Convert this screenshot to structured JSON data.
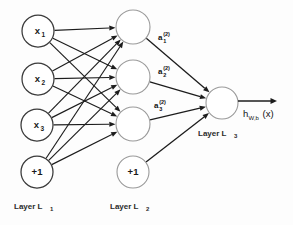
{
  "diagram": {
    "background_color": "#fdfdfd",
    "edge_color": "#1c1c1c",
    "input_node_stroke": "#3a3a3a",
    "hidden_node_stroke": "#9a9a9a",
    "output_node_stroke": "#9a9a9a"
  },
  "layers": [
    {
      "id": "L1",
      "caption_text": "Layer L",
      "caption_sub": "1",
      "caption_x": 14,
      "caption_y": 209,
      "nodes": [
        {
          "name": "input-node-x1",
          "label": "x",
          "sub": "1",
          "cx": 38,
          "cy": 31,
          "r": 16
        },
        {
          "name": "input-node-x2",
          "label": "x",
          "sub": "2",
          "cx": 38,
          "cy": 79,
          "r": 16
        },
        {
          "name": "input-node-x3",
          "label": "x",
          "sub": "3",
          "cx": 37,
          "cy": 125,
          "r": 16
        },
        {
          "name": "input-node-bias",
          "label": "+1",
          "sub": "",
          "cx": 37,
          "cy": 172,
          "r": 16
        }
      ]
    },
    {
      "id": "L2",
      "caption_text": "Layer L",
      "caption_sub": "2",
      "caption_x": 110,
      "caption_y": 209,
      "nodes": [
        {
          "name": "hidden-node-1",
          "label": "",
          "sub": "",
          "cx": 133,
          "cy": 27,
          "r": 17
        },
        {
          "name": "hidden-node-2",
          "label": "",
          "sub": "",
          "cx": 133,
          "cy": 77,
          "r": 17
        },
        {
          "name": "hidden-node-3",
          "label": "",
          "sub": "",
          "cx": 133,
          "cy": 124,
          "r": 17
        },
        {
          "name": "hidden-node-bias",
          "label": "+1",
          "sub": "",
          "cx": 133,
          "cy": 172,
          "r": 16
        }
      ]
    },
    {
      "id": "L3",
      "caption_text": "Layer L",
      "caption_sub": "3",
      "caption_x": 198,
      "caption_y": 136,
      "nodes": [
        {
          "name": "output-node",
          "label": "",
          "sub": "",
          "cx": 222,
          "cy": 103,
          "r": 16
        }
      ]
    }
  ],
  "activation_labels": [
    {
      "name": "activation-label-a1",
      "base": "a",
      "sup": "(2)",
      "sub": "1",
      "x": 158,
      "y": 40
    },
    {
      "name": "activation-label-a2",
      "base": "a",
      "sup": "(2)",
      "sub": "2",
      "x": 158,
      "y": 74
    },
    {
      "name": "activation-label-a3",
      "base": "a",
      "sup": "(2)",
      "sub": "3",
      "x": 154,
      "y": 108
    }
  ],
  "output": {
    "arrow": {
      "x1": 238,
      "y1": 101,
      "x2": 277,
      "y2": 101
    },
    "label_name": "output-label",
    "label_base": "h",
    "label_sub": "W,b",
    "label_tail": "(x)",
    "label_x": 243,
    "label_y": 117
  },
  "edges_input_to_hidden": [
    {
      "from": "input-node-x1",
      "to": "hidden-node-1"
    },
    {
      "from": "input-node-x1",
      "to": "hidden-node-2"
    },
    {
      "from": "input-node-x1",
      "to": "hidden-node-3"
    },
    {
      "from": "input-node-x2",
      "to": "hidden-node-1"
    },
    {
      "from": "input-node-x2",
      "to": "hidden-node-2"
    },
    {
      "from": "input-node-x2",
      "to": "hidden-node-3"
    },
    {
      "from": "input-node-x3",
      "to": "hidden-node-1"
    },
    {
      "from": "input-node-x3",
      "to": "hidden-node-2"
    },
    {
      "from": "input-node-x3",
      "to": "hidden-node-3"
    },
    {
      "from": "input-node-bias",
      "to": "hidden-node-1"
    },
    {
      "from": "input-node-bias",
      "to": "hidden-node-2"
    },
    {
      "from": "input-node-bias",
      "to": "hidden-node-3"
    }
  ],
  "edges_hidden_to_output": [
    {
      "from": "hidden-node-1",
      "to": "output-node"
    },
    {
      "from": "hidden-node-2",
      "to": "output-node"
    },
    {
      "from": "hidden-node-3",
      "to": "output-node"
    },
    {
      "from": "hidden-node-bias",
      "to": "output-node"
    }
  ]
}
